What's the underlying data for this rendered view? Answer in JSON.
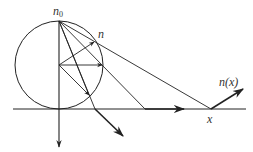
{
  "diagram": {
    "labels": {
      "n0_main": "n",
      "n0_sub": "0",
      "n": "n",
      "nx": "n(x)",
      "x": "x"
    },
    "colors": {
      "stroke": "#222222",
      "background": "#ffffff"
    },
    "geometry": {
      "circle": {
        "cx": 59,
        "cy": 65,
        "r": 44
      },
      "n0_point": [
        59,
        21
      ],
      "center_point": [
        59,
        65
      ],
      "n_point": [
        95,
        41
      ],
      "x_point": [
        211,
        109
      ],
      "axis_y": 109,
      "axis_x_range": [
        13,
        246
      ]
    },
    "elements": [
      "circle",
      "horizontal-axis",
      "vertical-line-with-down-arrow",
      "ray-n0-to-x-through-n",
      "ray-n0-to-axis-145",
      "ray-n0-to-axis-95",
      "ray-n0-to-circle-lower",
      "arrow-center-to-n",
      "arrow-center-horizontal",
      "arrow-center-to-lower-circle",
      "arrow-along-axis-right",
      "arrow-down-right-below-axis",
      "normal-arrow-at-x"
    ]
  }
}
